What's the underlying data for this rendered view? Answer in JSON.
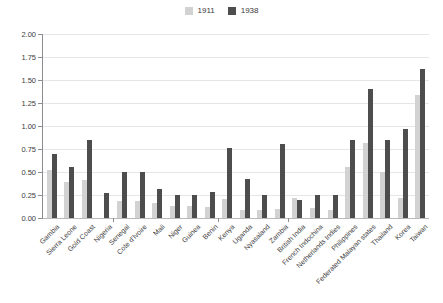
{
  "chart_data": {
    "type": "bar",
    "title": "",
    "subtitle": "",
    "xlabel": "",
    "ylabel": "",
    "ylim": [
      0,
      2.0
    ],
    "ytick_step": 0.25,
    "grid": true,
    "legend_position": "top-center",
    "categories": [
      "Gambia",
      "Sierra Leone",
      "Gold Coast",
      "Nigeria",
      "Senegal",
      "Cote d'Ivoire",
      "Mali",
      "Niger",
      "Guinea",
      "Benin",
      "Kenya",
      "Uganda",
      "Nyasaland",
      "Zambia",
      "British India",
      "French Indochina",
      "Netherlands Indies",
      "Philippines",
      "Federated Malayan states",
      "Thailand",
      "Korea",
      "Taiwan"
    ],
    "ytick_labels": [
      "0.00",
      "0.25",
      "0.50",
      "0.75",
      "1.00",
      "1.25",
      "1.50",
      "1.75",
      "2.00"
    ],
    "ytick_values": [
      0.0,
      0.25,
      0.5,
      0.75,
      1.0,
      1.25,
      1.5,
      1.75,
      2.0
    ],
    "group_breaks_after": [
      "Nigeria",
      "Benin",
      "Zambia"
    ],
    "series": [
      {
        "name": "1911",
        "color": "#d2d2d2",
        "values": [
          0.52,
          0.39,
          0.41,
          0.0,
          0.18,
          0.19,
          0.16,
          0.13,
          0.13,
          0.12,
          0.21,
          0.09,
          0.09,
          0.1,
          0.22,
          0.11,
          0.09,
          0.55,
          0.82,
          0.5,
          0.22,
          1.34
        ]
      },
      {
        "name": "1938",
        "color": "#4d4d4d",
        "values": [
          0.7,
          0.55,
          0.85,
          0.27,
          0.5,
          0.5,
          0.31,
          0.25,
          0.25,
          0.28,
          0.76,
          0.42,
          0.25,
          0.8,
          0.2,
          0.25,
          0.25,
          0.85,
          1.4,
          0.85,
          0.97,
          1.62
        ]
      }
    ]
  },
  "legend": {
    "entries": [
      {
        "label": "1911",
        "color": "#d2d2d2"
      },
      {
        "label": "1938",
        "color": "#4d4d4d"
      }
    ]
  }
}
